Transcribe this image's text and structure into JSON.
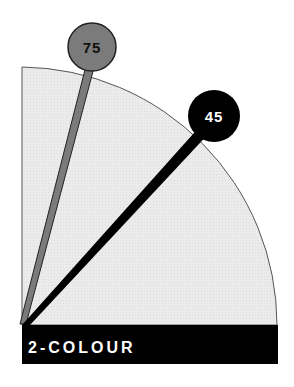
{
  "diagram": {
    "type": "quarter-dial",
    "pivot": {
      "x": 22,
      "y": 325
    },
    "radius": 258,
    "fill_color": "#e9e9e9",
    "outline_color": "#555555",
    "banner": {
      "label": "2-COLOUR",
      "background": "#000000",
      "text_color": "#ffffff"
    },
    "needles": [
      {
        "name": "needle-75",
        "value": "75",
        "angle_deg": 75,
        "tip": {
          "x": 92,
          "y": 47
        },
        "knob_radius": 24,
        "color": "#7b7b7b",
        "outline": "#222222",
        "text_color": "#111111",
        "width": 8
      },
      {
        "name": "needle-45",
        "value": "45",
        "angle_deg": 45,
        "tip": {
          "x": 214,
          "y": 116
        },
        "knob_radius": 26,
        "color": "#000000",
        "outline": "#000000",
        "text_color": "#ffffff",
        "width": 11
      }
    ]
  }
}
